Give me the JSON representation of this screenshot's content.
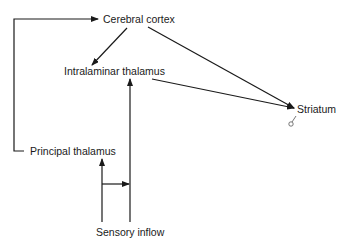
{
  "diagram": {
    "nodes": [
      {
        "id": "cortex",
        "label": "Cerebral cortex"
      },
      {
        "id": "intralaminar",
        "label": "Intralaminar thalamus"
      },
      {
        "id": "striatum",
        "label": "Striatum"
      },
      {
        "id": "principal",
        "label": "Principal thalamus"
      },
      {
        "id": "sensory",
        "label": "Sensory inflow"
      }
    ],
    "edges": [
      {
        "from": "principal",
        "to": "cortex"
      },
      {
        "from": "cortex",
        "to": "intralaminar"
      },
      {
        "from": "cortex",
        "to": "striatum"
      },
      {
        "from": "intralaminar",
        "to": "striatum"
      },
      {
        "from": "sensory",
        "to": "principal"
      },
      {
        "from": "sensory",
        "to": "intralaminar"
      },
      {
        "from": "sensory-principal-branch",
        "to": "sensory-intralaminar-branch"
      }
    ],
    "line_color": "#1a1a1a"
  }
}
